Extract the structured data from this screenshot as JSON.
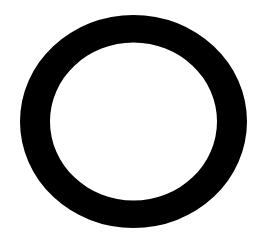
{
  "canvas": {
    "width": 264,
    "height": 234,
    "background": "#ffffff"
  },
  "shape": {
    "type": "ring",
    "color": "#000000",
    "center": [
      133.5,
      121.5
    ],
    "outer_radius": [
      113.5,
      106.5
    ],
    "inner_radius": [
      83.5,
      79
    ]
  }
}
